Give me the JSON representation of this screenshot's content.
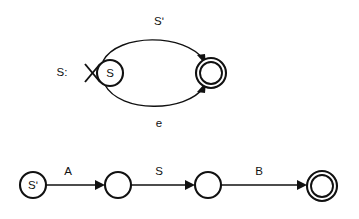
{
  "figure": {
    "background_color": "#ffffff",
    "stroke_color": "#111111"
  },
  "automata": [
    {
      "name": "top-automaton",
      "group_label": "S:",
      "start_marker": "cross-start-marker",
      "states": [
        {
          "id": "s-state",
          "label": "S",
          "accepting": false,
          "cx": 110,
          "cy": 73,
          "r": 13
        },
        {
          "id": "top-accept-state",
          "label": "",
          "accepting": true,
          "cx": 211,
          "cy": 73,
          "r": 15,
          "r_inner": 11
        }
      ],
      "transitions": [
        {
          "id": "top-arc-transition",
          "label": "Sʹ",
          "from": "s-state",
          "to": "top-accept-state",
          "shape": "arc-upper"
        },
        {
          "id": "bottom-arc-transition",
          "label": "e",
          "from": "s-state",
          "to": "top-accept-state",
          "shape": "arc-lower"
        }
      ]
    },
    {
      "name": "bottom-automaton",
      "states": [
        {
          "id": "b-state-0",
          "label": "Sʹ",
          "accepting": false,
          "cx": 33,
          "cy": 185,
          "r": 13
        },
        {
          "id": "b-state-1",
          "label": "",
          "accepting": false,
          "cx": 118,
          "cy": 185,
          "r": 13
        },
        {
          "id": "b-state-2",
          "label": "",
          "accepting": false,
          "cx": 208,
          "cy": 185,
          "r": 13
        },
        {
          "id": "b-accept-state",
          "label": "",
          "accepting": true,
          "cx": 322,
          "cy": 186,
          "r": 15,
          "r_inner": 11
        }
      ],
      "transitions": [
        {
          "id": "edge-a",
          "label": "A",
          "from": "b-state-0",
          "to": "b-state-1",
          "shape": "straight"
        },
        {
          "id": "edge-s",
          "label": "S",
          "from": "b-state-1",
          "to": "b-state-2",
          "shape": "straight"
        },
        {
          "id": "edge-b",
          "label": "B",
          "from": "b-state-2",
          "to": "b-accept-state",
          "shape": "straight"
        }
      ]
    }
  ],
  "labels": {
    "group_s": "S:",
    "arc_upper": "Sʹ",
    "arc_lower": "e",
    "state_s": "S",
    "state_s_prime": "Sʹ",
    "edge_a": "A",
    "edge_s": "S",
    "edge_b": "B"
  }
}
